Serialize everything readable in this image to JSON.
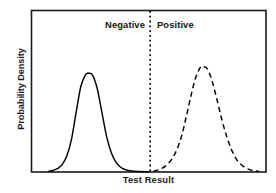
{
  "chart_data": {
    "type": "line",
    "title": "",
    "subtitle": "",
    "xlabel": "Test Result",
    "ylabel": "Probability Density",
    "xlim": [
      0,
      100
    ],
    "ylim": [
      0,
      1.08
    ],
    "grid": false,
    "legend": null,
    "axis_ticks": {
      "x": [],
      "y": []
    },
    "annotations": [
      {
        "name": "negative-region-label",
        "text": "Negative",
        "x": 44.0,
        "y": 0.95,
        "align": "right",
        "bold": true
      },
      {
        "name": "positive-region-label",
        "text": "Positive",
        "x": 56.0,
        "y": 0.95,
        "align": "left",
        "bold": true
      }
    ],
    "threshold_line": {
      "name": "decision-threshold",
      "x": 50.6,
      "style": "dotted",
      "color": "#000000",
      "orientation": "vertical"
    },
    "series": [
      {
        "name": "Negative distribution",
        "style": "solid",
        "color": "#000000",
        "peak_x": 24.3,
        "peak_y": 0.66,
        "x": [
          7.2,
          9.0,
          11.0,
          13.0,
          15.0,
          17.0,
          19.0,
          21.0,
          23.0,
          24.3,
          26.0,
          28.0,
          30.0,
          32.0,
          34.0,
          36.0,
          38.0,
          40.0,
          42.0,
          44.0,
          46.0,
          48.0,
          50.0
        ],
        "y": [
          0.004,
          0.01,
          0.022,
          0.048,
          0.105,
          0.215,
          0.395,
          0.57,
          0.65,
          0.66,
          0.648,
          0.56,
          0.4,
          0.24,
          0.13,
          0.066,
          0.032,
          0.016,
          0.008,
          0.005,
          0.003,
          0.002,
          0.002
        ]
      },
      {
        "name": "Positive distribution",
        "style": "dashed",
        "color": "#000000",
        "peak_x": 73.2,
        "peak_y": 0.705,
        "x": [
          52.0,
          54.0,
          56.0,
          58.0,
          60.0,
          62.0,
          64.0,
          66.0,
          68.0,
          70.0,
          72.0,
          73.2,
          75.0,
          77.0,
          79.0,
          81.0,
          83.0,
          85.0,
          87.0,
          89.0,
          91.0,
          93.0,
          95.0,
          97.0
        ],
        "y": [
          0.006,
          0.014,
          0.028,
          0.052,
          0.09,
          0.15,
          0.24,
          0.37,
          0.51,
          0.63,
          0.7,
          0.705,
          0.69,
          0.61,
          0.49,
          0.36,
          0.25,
          0.16,
          0.095,
          0.055,
          0.03,
          0.016,
          0.008,
          0.004
        ]
      }
    ]
  },
  "figure": {
    "ylabel_text": "Probability Density",
    "xlabel_text": "Test Result",
    "label_negative": "Negative",
    "label_positive": "Positive",
    "frame_color": "#1a1a1a",
    "background": "#ffffff",
    "curve_color": "#000000"
  }
}
